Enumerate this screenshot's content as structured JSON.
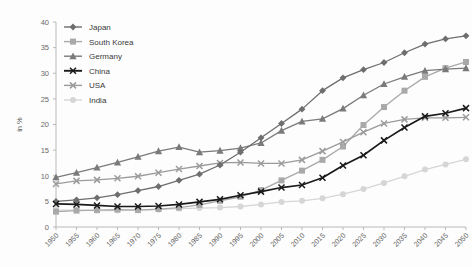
{
  "chart_data": {
    "type": "line",
    "title": "",
    "subtitle": "",
    "xlabel": "",
    "ylabel": "in %",
    "ylim": [
      0,
      40
    ],
    "ytick_step": 5,
    "yticks": [
      "0",
      "5",
      "10",
      "15",
      "20",
      "25",
      "30",
      "35",
      "40"
    ],
    "grid": false,
    "legend_position": "top-left",
    "x": [
      1950,
      1955,
      1960,
      1965,
      1970,
      1975,
      1980,
      1985,
      1990,
      1995,
      2000,
      2005,
      2010,
      2015,
      2020,
      2025,
      2030,
      2035,
      2040,
      2045,
      2050
    ],
    "xtick_labels": [
      "1950",
      "1955",
      "1960",
      "1965",
      "1970",
      "1975",
      "1980",
      "1985",
      "1990",
      "1995",
      "2000",
      "2005",
      "2010",
      "2015",
      "2020",
      "2025",
      "2030",
      "2035",
      "2040",
      "2045",
      "2050"
    ],
    "series": [
      {
        "name": "Japan",
        "color": "#6e6e6e",
        "marker": "diamond",
        "values": [
          5.0,
          5.3,
          5.7,
          6.3,
          7.1,
          7.9,
          9.1,
          10.3,
          12.1,
          14.6,
          17.4,
          20.2,
          23.0,
          26.6,
          29.1,
          30.7,
          32.1,
          34.0,
          35.7,
          36.7,
          37.3
        ]
      },
      {
        "name": "South Korea",
        "color": "#a9a9a9",
        "marker": "square",
        "values": [
          3.0,
          3.2,
          3.3,
          3.4,
          3.3,
          3.5,
          3.8,
          4.3,
          5.1,
          5.9,
          7.2,
          9.1,
          11.0,
          13.1,
          15.7,
          19.9,
          23.4,
          26.6,
          29.3,
          31.0,
          32.2
        ]
      },
      {
        "name": "Germany",
        "color": "#7a7a7a",
        "marker": "triangle",
        "values": [
          9.7,
          10.6,
          11.6,
          12.6,
          13.7,
          14.8,
          15.6,
          14.6,
          14.9,
          15.4,
          16.4,
          18.8,
          20.6,
          21.1,
          23.1,
          25.7,
          27.9,
          29.3,
          30.5,
          30.8,
          31.0
        ]
      },
      {
        "name": "China",
        "color": "#1a1a1a",
        "marker": "x",
        "values": [
          4.5,
          4.4,
          4.2,
          4.0,
          4.0,
          4.1,
          4.4,
          4.9,
          5.4,
          6.2,
          6.9,
          7.7,
          8.2,
          9.6,
          12.0,
          14.0,
          16.9,
          19.4,
          21.6,
          22.2,
          23.2
        ]
      },
      {
        "name": "USA",
        "color": "#9b9b9b",
        "marker": "x",
        "values": [
          8.4,
          9.0,
          9.2,
          9.5,
          9.9,
          10.6,
          11.3,
          11.9,
          12.5,
          12.6,
          12.4,
          12.4,
          13.1,
          14.8,
          16.6,
          18.5,
          20.2,
          21.0,
          21.3,
          21.3,
          21.4
        ]
      },
      {
        "name": "India",
        "color": "#d6d6d6",
        "marker": "circle",
        "values": [
          3.3,
          3.3,
          3.2,
          3.2,
          3.3,
          3.4,
          3.6,
          3.7,
          3.8,
          4.0,
          4.4,
          4.9,
          5.1,
          5.6,
          6.4,
          7.4,
          8.6,
          9.9,
          11.2,
          12.2,
          13.2
        ]
      }
    ]
  },
  "legend": {
    "items": [
      {
        "label": "Japan"
      },
      {
        "label": "South Korea"
      },
      {
        "label": "Germany"
      },
      {
        "label": "China"
      },
      {
        "label": "USA"
      },
      {
        "label": "India"
      }
    ]
  },
  "axes": {
    "y_title": "in %"
  }
}
